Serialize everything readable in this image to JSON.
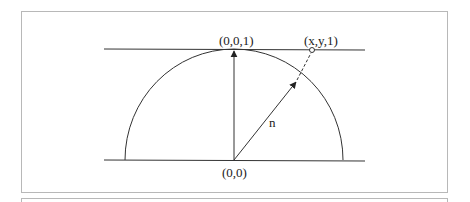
{
  "figure": {
    "labels": {
      "top_point": "(0,0,1)",
      "projected_point": "(x,y,1)",
      "origin": "(0,0)",
      "normal_vector": "n"
    },
    "colors": {
      "stroke": "#333333",
      "frame": "#b8b8b8",
      "background": "#ffffff"
    }
  }
}
